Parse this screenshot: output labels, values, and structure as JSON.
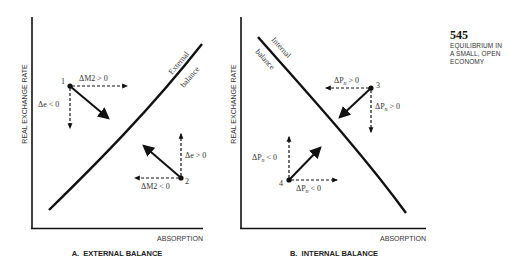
{
  "sidebar": {
    "page_number": "545",
    "section_lines": [
      "EQUILIBRIUM IN",
      "A SMALL, OPEN",
      "ECONOMY"
    ]
  },
  "panels": [
    {
      "id": "A",
      "caption": "A.  EXTERNAL BALANCE",
      "y_axis_label": "REAL EXCHANGE RATE",
      "x_axis_label": "ABSORPTION",
      "curve_label_line1": "External",
      "curve_label_line2": "balance",
      "points": [
        {
          "label": "1",
          "horizontal": "ΔM2 > 0",
          "vertical": "Δe < 0"
        },
        {
          "label": "2",
          "horizontal": "ΔM2 < 0",
          "vertical": "Δe > 0"
        }
      ]
    },
    {
      "id": "B",
      "caption": "B.  INTERNAL BALANCE",
      "y_axis_label": "REAL EXCHANGE RATE",
      "x_axis_label": "ABSORPTION",
      "curve_label_line1": "Internal",
      "curve_label_line2": "balance",
      "points": [
        {
          "label": "3",
          "horizontal_prefix": "ΔP",
          "horizontal_sub": "n",
          "horizontal_suffix": " > 0",
          "vertical_prefix": "ΔP",
          "vertical_sub": "n",
          "vertical_suffix": " > 0"
        },
        {
          "label": "4",
          "horizontal_prefix": "ΔP",
          "horizontal_sub": "n",
          "horizontal_suffix": " < 0",
          "vertical_prefix": "ΔP",
          "vertical_sub": "n",
          "vertical_suffix": " < 0"
        }
      ]
    }
  ],
  "colors": {
    "ink": "#111111",
    "text": "#333333",
    "background": "#ffffff"
  }
}
